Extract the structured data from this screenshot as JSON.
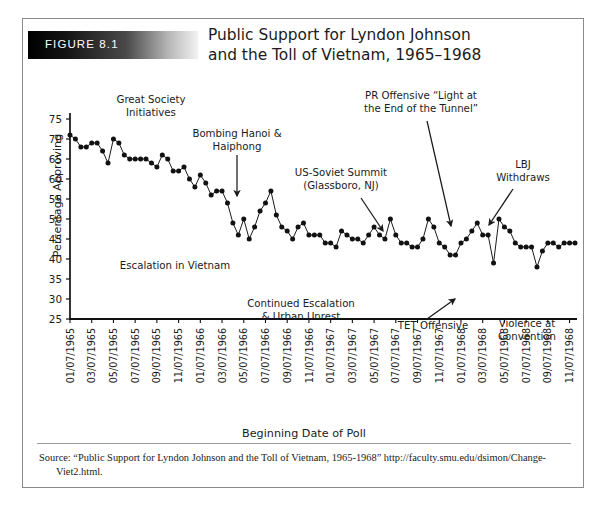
{
  "figure": {
    "badge_label": "FIGURE 8.1",
    "title_line1": "Public Support for Lyndon Johnson",
    "title_line2": "and the Toll of Vietnam, 1965–1968",
    "source_line1": "Source: “Public Support for Lyndon Johnson and the Toll of Vietnam, 1965-1968” http://faculty.smu.edu/dsimon/Change-",
    "source_line2": "Viet2.html."
  },
  "colors": {
    "line": "#1b1b1b",
    "marker": "#111111",
    "axis": "#111111",
    "text": "#1b1b1b",
    "badge_dark": "#000000",
    "badge_light": "#f2f2f2",
    "badge_text": "#ffffff",
    "background": "#ffffff",
    "border": "#8a8a8a"
  },
  "chart_data": {
    "type": "line",
    "title": "Public Support for Lyndon Johnson and the Toll of Vietnam, 1965–1968",
    "xlabel": "Beginning Date of Poll",
    "ylabel": "Percentage Approving",
    "ylim": [
      25,
      75
    ],
    "yticks": [
      25,
      30,
      35,
      40,
      45,
      50,
      55,
      60,
      65,
      70,
      75
    ],
    "grid": false,
    "legend": "none",
    "xtick_labels": [
      "01/07/1965",
      "03/07/1965",
      "05/07/1965",
      "07/07/1965",
      "09/07/1965",
      "11/07/1965",
      "01/07/1966",
      "03/07/1966",
      "05/07/1966",
      "07/07/1966",
      "09/07/1966",
      "11/07/1966",
      "01/07/1967",
      "03/07/1967",
      "05/07/1967",
      "07/07/1967",
      "09/07/1967",
      "11/07/1967",
      "01/07/1968",
      "03/07/1968",
      "05/07/1968",
      "07/07/1968",
      "09/07/1968",
      "11/07/1968"
    ],
    "xtick_indices": [
      0,
      4,
      8,
      12,
      16,
      20,
      24,
      28,
      32,
      36,
      40,
      44,
      48,
      52,
      56,
      60,
      64,
      68,
      72,
      76,
      80,
      84,
      88,
      92
    ],
    "series": [
      {
        "name": "Percentage Approving",
        "values": [
          71,
          70,
          68,
          68,
          69,
          69,
          67,
          64,
          70,
          69,
          66,
          65,
          65,
          65,
          65,
          64,
          63,
          66,
          65,
          62,
          62,
          63,
          60,
          58,
          61,
          59,
          56,
          57,
          57,
          54,
          49,
          46,
          50,
          45,
          48,
          52,
          54,
          57,
          51,
          48,
          47,
          45,
          48,
          49,
          46,
          46,
          46,
          44,
          44,
          43,
          47,
          46,
          45,
          45,
          44,
          46,
          48,
          46,
          45,
          50,
          46,
          44,
          44,
          43,
          43,
          45,
          50,
          48,
          44,
          43,
          41,
          41,
          44,
          45,
          47,
          49,
          46,
          46,
          39,
          50,
          48,
          47,
          44,
          43,
          43,
          43,
          38,
          42,
          44,
          44,
          43,
          44,
          44,
          44
        ]
      }
    ],
    "annotations": [
      {
        "id": "great-society",
        "line1": "Great Society",
        "line2": "Initiatives",
        "has_arrow": false
      },
      {
        "id": "bombing-hanoi",
        "line1": "Bombing Hanoi &",
        "line2": "Haiphong",
        "has_arrow": true
      },
      {
        "id": "escalation-vietnam",
        "line1": "Escalation in Vietnam",
        "line2": "",
        "has_arrow": false
      },
      {
        "id": "us-soviet-summit",
        "line1": "US-Soviet Summit",
        "line2": "(Glassboro, NJ)",
        "has_arrow": true
      },
      {
        "id": "continued-escalation",
        "line1": "Continued Escalation",
        "line2": "& Urban Unrest",
        "has_arrow": false
      },
      {
        "id": "pr-offensive",
        "line1": "PR Offensive “Light at",
        "line2": "the End of the Tunnel”",
        "has_arrow": true
      },
      {
        "id": "lbj-withdraws",
        "line1": "LBJ",
        "line2": "Withdraws",
        "has_arrow": true
      },
      {
        "id": "tet-offensive",
        "line1": "TET Offensive",
        "line2": "",
        "has_arrow": true
      },
      {
        "id": "violence-convention",
        "line1": "Violence at",
        "line2": "Convention",
        "has_arrow": false
      }
    ]
  }
}
